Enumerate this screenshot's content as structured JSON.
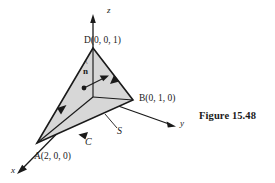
{
  "figure": {
    "caption": "Figure 15.48",
    "surface_label": "S",
    "curve_label": "C",
    "normal_label": "n",
    "normal_accent": "^",
    "fill_color": "#d7d7d7",
    "line_color": "#1a1a1a"
  },
  "axes": [
    {
      "name": "z-axis",
      "label": "z"
    },
    {
      "name": "y-axis",
      "label": "y"
    },
    {
      "name": "x-axis",
      "label": "x"
    }
  ],
  "vertices": [
    {
      "name": "vertex-D",
      "label": "D(0, 0, 1)",
      "point": "D",
      "coords": "(0, 0, 1)"
    },
    {
      "name": "vertex-B",
      "label": "B(0, 1, 0)",
      "point": "B",
      "coords": "(0, 1, 0)"
    },
    {
      "name": "vertex-A",
      "label": "A(2, 0, 0)",
      "point": "A",
      "coords": "(2, 0, 0)"
    }
  ]
}
